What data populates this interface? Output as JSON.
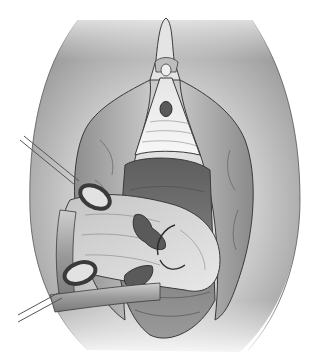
{
  "illustration": {
    "kind": "grayscale surgical illustration",
    "width": 316,
    "height": 359,
    "palette": {
      "background": "#ffffff",
      "outline": "#3a3a3a",
      "skin_light": "#ececec",
      "skin_mid": "#bdbdbd",
      "skin_dark": "#8f8f8f",
      "tissue_light": "#f4f4f4",
      "tissue_mid": "#a9a9a9",
      "cavity_dark": "#6e6e6e",
      "instrument": "#9a9a9a",
      "instrument_highlight": "#d8d8d8",
      "lesion": "#5a5a5a"
    },
    "regions": [
      "outer-field",
      "upper-triangle",
      "central-mark",
      "left-fold",
      "right-fold",
      "lower-cavity",
      "retracted-tissue",
      "suture-site",
      "instrument-upper",
      "instrument-lower"
    ]
  }
}
